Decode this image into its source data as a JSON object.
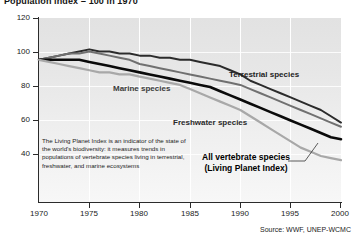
{
  "title": "Population index = 100 in 1970",
  "source": "Source: WWF, UNEP-WCMC",
  "blurb": "The Living Planet Index is an indicator of the state of the world's biodiversity: it measures trends in populations of vertebrate species living in terrestrial, freshwater, and marine ecosystems",
  "labels": {
    "terrestrial": "Terrestrial species",
    "marine": "Marine species",
    "freshwater": "Freshwater species",
    "allvert_line1": "All vertebrate species",
    "allvert_line2": "(Living Planet Index)"
  },
  "axis": {
    "y_ticks": [
      "120",
      "100",
      "80",
      "60",
      "40"
    ],
    "x_ticks": [
      "1970",
      "1975",
      "1980",
      "1985",
      "1990",
      "1995",
      "2000"
    ]
  },
  "chart_data": {
    "type": "line",
    "title": "Population index = 100 in 1970",
    "xlabel": "",
    "ylabel": "Population index (1970 = 100)",
    "xlim": [
      1970,
      2000
    ],
    "ylim": [
      32,
      120
    ],
    "grid": true,
    "legend": "inline-annotations",
    "x": [
      1970,
      1971,
      1972,
      1973,
      1974,
      1975,
      1976,
      1977,
      1978,
      1979,
      1980,
      1981,
      1982,
      1983,
      1984,
      1985,
      1986,
      1987,
      1988,
      1989,
      1990,
      1991,
      1992,
      1993,
      1994,
      1995,
      1996,
      1997,
      1998,
      1999,
      2000
    ],
    "series": [
      {
        "name": "Terrestrial species",
        "color": "#2b2b2b",
        "width": 2.0,
        "values": [
          100,
          101,
          102,
          103,
          104,
          105,
          104,
          104,
          103,
          103,
          102,
          102,
          101,
          101,
          100,
          100,
          99,
          98,
          97,
          95,
          93,
          90,
          88,
          86,
          84,
          82,
          80,
          78,
          76,
          73,
          70
        ]
      },
      {
        "name": "Freshwater species",
        "color": "#707070",
        "width": 2.0,
        "values": [
          100,
          101,
          102,
          103,
          103,
          104,
          103,
          102,
          101,
          100,
          98,
          97,
          96,
          95,
          94,
          93,
          92,
          91,
          90,
          89,
          88,
          86,
          84,
          82,
          80,
          78,
          76,
          74,
          72,
          70,
          68
        ]
      },
      {
        "name": "All vertebrate species (Living Planet Index)",
        "color": "#0a0a0a",
        "width": 2.6,
        "values": [
          100,
          100,
          100,
          100,
          100,
          99,
          98,
          97,
          96,
          95,
          94,
          93,
          92,
          91,
          90,
          89,
          88,
          87,
          85,
          83,
          81,
          79,
          77,
          75,
          73,
          71,
          69,
          67,
          65,
          63,
          62
        ]
      },
      {
        "name": "Marine species",
        "color": "#a8a8a8",
        "width": 2.2,
        "values": [
          100,
          99,
          98,
          97,
          96,
          95,
          94,
          94,
          93,
          93,
          92,
          91,
          90,
          89,
          88,
          86,
          84,
          82,
          80,
          78,
          76,
          73,
          70,
          67,
          64,
          61,
          58,
          56,
          54,
          53,
          52
        ]
      }
    ],
    "annotations": [
      {
        "text": "Terrestrial species",
        "x": 1993,
        "y": 85
      },
      {
        "text": "Marine species",
        "x": 1977,
        "y": 81
      },
      {
        "text": "Freshwater species",
        "x": 1984,
        "y": 63
      },
      {
        "text": "All vertebrate species (Living Planet Index)",
        "x": 1987,
        "y": 45
      }
    ]
  }
}
